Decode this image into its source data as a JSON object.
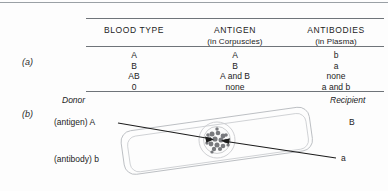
{
  "figure": {
    "part_a_label": "(a)",
    "part_b_label": "(b)"
  },
  "table": {
    "columns": [
      {
        "header": "BLOOD TYPE",
        "subheader": ""
      },
      {
        "header": "ANTIGEN",
        "subheader": "(in Corpuscles)"
      },
      {
        "header": "ANTIBODIES",
        "subheader": "(in Plasma)"
      }
    ],
    "rows": [
      {
        "blood_type": "A",
        "antigen": "A",
        "antibodies": "b"
      },
      {
        "blood_type": "B",
        "antigen": "B",
        "antibodies": "a"
      },
      {
        "blood_type": "AB",
        "antigen": "A and B",
        "antibodies": "none"
      },
      {
        "blood_type": "0",
        "antigen": "none",
        "antibodies": "a and b"
      }
    ]
  },
  "diagram": {
    "donor_title": "Donor",
    "recipient_title": "Recipient",
    "donor_antigen": "(antigen) A",
    "donor_antibody": "(antibody) b",
    "recipient_antigen": "B",
    "recipient_antibody": "a",
    "agglutination_cluster": "clumped-red-cells",
    "vessel_shape": "tilted-rounded-rectangle"
  },
  "colors": {
    "rule": "#8e9196",
    "text": "#1c1c1c",
    "arrow": "#1b1b1b",
    "vessel_outline": "#b9bcc0",
    "cluster": "#6d6f73",
    "background": "#fdfdfd"
  }
}
